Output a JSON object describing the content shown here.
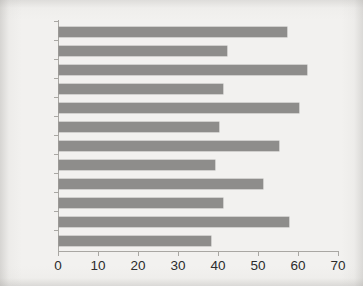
{
  "chart_data": {
    "type": "bar",
    "orientation": "horizontal",
    "title": "",
    "subtitle": "",
    "xlabel": "",
    "ylabel": "",
    "categories": [
      "2012",
      "2010",
      "2008",
      "2006",
      "2004",
      "2002",
      "2000",
      "1998",
      "1996",
      "1994",
      "1992",
      "1990"
    ],
    "values": [
      57,
      42,
      62,
      41,
      60,
      40,
      55,
      39,
      51,
      41,
      57.5,
      38
    ],
    "series": [
      {
        "name": "",
        "values": [
          57,
          42,
          62,
          41,
          60,
          40,
          55,
          39,
          51,
          41,
          57.5,
          38
        ]
      }
    ],
    "xlim": [
      0,
      70
    ],
    "xticks": [
      0,
      10,
      20,
      30,
      40,
      50,
      60,
      70
    ],
    "xtick_labels": [
      "0",
      "10",
      "20",
      "30",
      "40",
      "50",
      "60",
      "70"
    ],
    "ytick_labels": [
      "2012",
      "2010",
      "2008",
      "2006",
      "2004",
      "2002",
      "2000",
      "1998",
      "1996",
      "1994",
      "1992",
      "1990"
    ],
    "grid": false,
    "legend": null,
    "legend_position": "none",
    "bar_color": "#8e8d8b",
    "axis_color": "#a9a7a3",
    "text_color": "#2b2b2b",
    "background_color": "#f2f1ef",
    "annotations": []
  }
}
